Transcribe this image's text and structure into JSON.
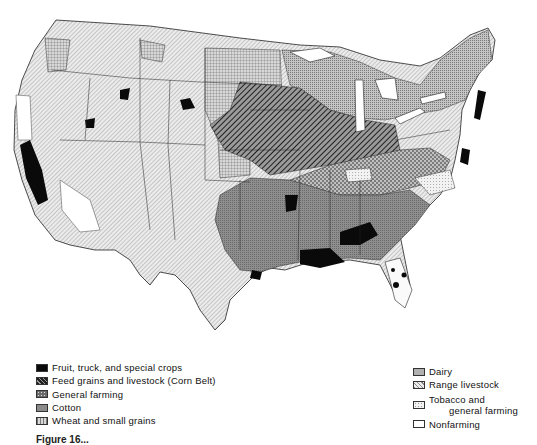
{
  "map": {
    "subject": "Generalized types of farming in the conterminous United States",
    "region": "United States (48 states)"
  },
  "legend": {
    "left": [
      {
        "key": "fruit",
        "label": "Fruit, truck, and special crops",
        "pattern": "solid-black",
        "color": "#0a0a0a"
      },
      {
        "key": "feed",
        "label": "Feed grains and livestock (Corn Belt)",
        "pattern": "heavy-diagonal",
        "color": "#3a3a3a"
      },
      {
        "key": "general",
        "label": "General farming",
        "pattern": "crosshatch-dots",
        "color": "#6a6a6a"
      },
      {
        "key": "cotton",
        "label": "Cotton",
        "pattern": "medium-stipple",
        "color": "#8a8a8a"
      },
      {
        "key": "wheat",
        "label": "Wheat and small grains",
        "pattern": "grid",
        "color": "#b4b4b4"
      }
    ],
    "right": [
      {
        "key": "dairy",
        "label": "Dairy",
        "pattern": "fine-stipple",
        "color": "#aaaaaa"
      },
      {
        "key": "range",
        "label": "Range livestock",
        "pattern": "light-diagonal",
        "color": "#d2d2d2"
      },
      {
        "key": "tobacco",
        "label_line1": "Tobacco and",
        "label_line2": "general farming",
        "pattern": "light-dots",
        "color": "#e4e4e4"
      },
      {
        "key": "nonfarm",
        "label": "Nonfarming",
        "pattern": "blank",
        "color": "#ffffff"
      }
    ]
  },
  "caption": {
    "text": "Figure 16..."
  }
}
